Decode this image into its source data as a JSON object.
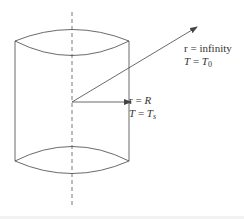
{
  "diagram": {
    "type": "cylinder-radial-heat-conduction",
    "inner_label": {
      "r_line": {
        "lhs": "r",
        "eq": " = ",
        "rhs": "R"
      },
      "t_line": {
        "lhs": "T",
        "eq": " = ",
        "rhs": "T",
        "sub": "s"
      }
    },
    "outer_label": {
      "r_line": {
        "lhs": "r",
        "eq": " = ",
        "rhs": "infinity"
      },
      "t_line": {
        "lhs": "T",
        "eq": " = ",
        "rhs": "T",
        "sub": "0"
      }
    },
    "colors": {
      "stroke": "#444444",
      "text": "#333333"
    }
  }
}
